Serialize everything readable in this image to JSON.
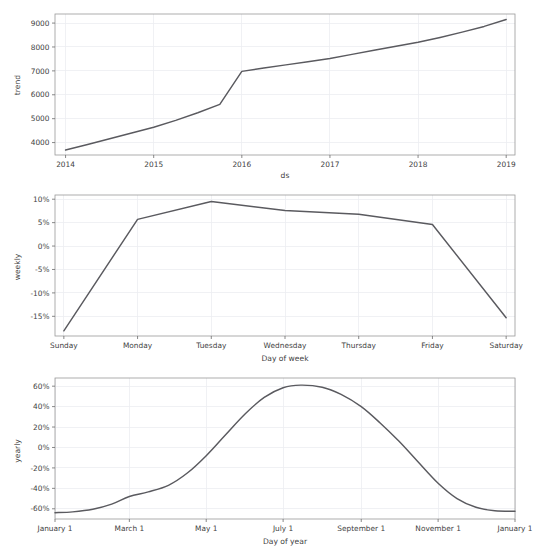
{
  "figure": {
    "width": 534,
    "height": 548,
    "background_color": "#ffffff",
    "line_color": "#5a5a5f",
    "grid_color": "#eceef1",
    "axis_color": "#6b6b6b",
    "text_color": "#3f3f3f"
  },
  "chart_data": [
    {
      "type": "line",
      "name": "trend-panel",
      "title": "",
      "xlabel": "ds",
      "ylabel": "trend",
      "grid": true,
      "legend": "none",
      "xtick_labels": [
        "2014",
        "2015",
        "2016",
        "2017",
        "2018",
        "2019"
      ],
      "xtick_values": [
        2014,
        2015,
        2016,
        2017,
        2018,
        2019
      ],
      "ytick_labels": [
        "4000",
        "5000",
        "6000",
        "7000",
        "8000",
        "9000"
      ],
      "ytick_values": [
        4000,
        5000,
        6000,
        7000,
        8000,
        9000
      ],
      "xlim": [
        2013.88,
        2019.1
      ],
      "ylim": [
        3480,
        9380
      ],
      "x": [
        2014.0,
        2014.25,
        2014.5,
        2014.75,
        2015.0,
        2015.25,
        2015.5,
        2015.75,
        2016.0,
        2016.25,
        2016.5,
        2016.75,
        2017.0,
        2017.25,
        2017.5,
        2017.75,
        2018.0,
        2018.25,
        2018.5,
        2018.75,
        2019.0
      ],
      "values": [
        3690,
        3920,
        4160,
        4400,
        4640,
        4930,
        5250,
        5600,
        6980,
        7120,
        7250,
        7380,
        7520,
        7690,
        7860,
        8030,
        8200,
        8400,
        8620,
        8860,
        9150
      ]
    },
    {
      "type": "line",
      "name": "weekly-panel",
      "title": "",
      "xlabel": "Day of week",
      "ylabel": "weekly",
      "grid": true,
      "legend": "none",
      "xtick_labels": [
        "Sunday",
        "Monday",
        "Tuesday",
        "Wednesday",
        "Thursday",
        "Friday",
        "Saturday"
      ],
      "ytick_labels": [
        "10%",
        "5%",
        "0%",
        "-5%",
        "-10%",
        "-15%"
      ],
      "ytick_values": [
        10,
        5,
        0,
        -5,
        -10,
        -15
      ],
      "xlim": [
        -0.12,
        6.12
      ],
      "ylim": [
        -19.2,
        10.9
      ],
      "categories": [
        "Sunday",
        "Monday",
        "Tuesday",
        "Wednesday",
        "Thursday",
        "Friday",
        "Saturday"
      ],
      "values": [
        -18.1,
        5.7,
        9.5,
        7.6,
        6.8,
        4.6,
        -15.3
      ],
      "units": "percent"
    },
    {
      "type": "line",
      "name": "yearly-panel",
      "title": "",
      "xlabel": "Day of year",
      "ylabel": "yearly",
      "grid": true,
      "legend": "none",
      "xtick_labels": [
        "January 1",
        "March 1",
        "May 1",
        "July 1",
        "September 1",
        "November 1",
        "January 1"
      ],
      "xtick_days": [
        1,
        60,
        121,
        182,
        244,
        305,
        366
      ],
      "ytick_labels": [
        "60%",
        "40%",
        "20%",
        "0%",
        "-20%",
        "-40%",
        "-60%"
      ],
      "ytick_values": [
        60,
        40,
        20,
        0,
        -20,
        -40,
        -60
      ],
      "xlim": [
        1,
        366
      ],
      "ylim": [
        -70,
        68
      ],
      "x": [
        1,
        15,
        31,
        46,
        60,
        75,
        91,
        106,
        121,
        136,
        152,
        167,
        182,
        196,
        213,
        228,
        244,
        259,
        274,
        289,
        305,
        320,
        335,
        350,
        366
      ],
      "values": [
        -63.8,
        -63.0,
        -60.5,
        -55.5,
        -48.0,
        -43.5,
        -37.0,
        -25.0,
        -8.0,
        12.0,
        33.0,
        49.0,
        58.5,
        61.0,
        59.0,
        52.0,
        40.0,
        24.0,
        6.0,
        -14.0,
        -35.0,
        -50.0,
        -58.5,
        -62.0,
        -62.5
      ],
      "units": "percent"
    }
  ]
}
